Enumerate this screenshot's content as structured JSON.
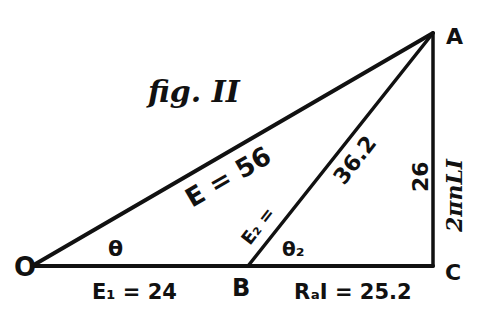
{
  "figure": {
    "title": "fig. II",
    "stroke_color": "#111111",
    "background": "#ffffff"
  },
  "vertices": {
    "O": {
      "label": "O",
      "x": 32,
      "y": 266
    },
    "B": {
      "label": "B",
      "x": 248,
      "y": 266
    },
    "C": {
      "label": "C",
      "x": 433,
      "y": 266
    },
    "A": {
      "label": "A",
      "x": 433,
      "y": 32
    }
  },
  "edges": {
    "OA": {
      "label": "E = 56"
    },
    "BA": {
      "label": "36.2",
      "side_label": "E₂ ="
    },
    "CA": {
      "label": "26",
      "side_label": "2πnLI"
    },
    "OB": {
      "label": "E₁ = 24"
    },
    "BC": {
      "label": "RₐI = 25.2"
    }
  },
  "angles": {
    "theta": {
      "label": "θ"
    },
    "theta2": {
      "label": "θ₂"
    }
  }
}
